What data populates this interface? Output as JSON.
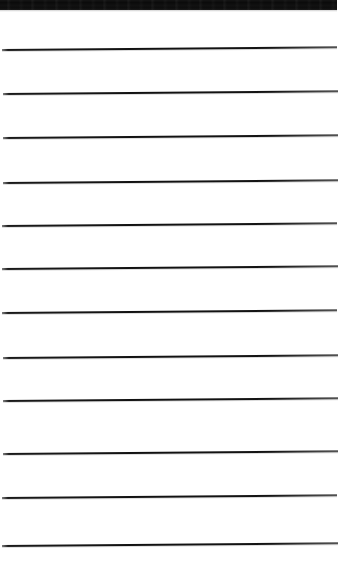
{
  "document": {
    "kind": "scanned-page",
    "subject": "blank ruled notepad page",
    "page_width": 344,
    "page_height": 576,
    "paper_color": "#ffffff",
    "ink_color": "#111111",
    "text_content": "",
    "has_handwriting": false,
    "has_printed_text": false
  },
  "top_edge_band": {
    "name": "top-edge-band",
    "color": "#0d0d0d",
    "x": 0,
    "y": 0,
    "width": 337,
    "height": 10
  },
  "ruling": {
    "line_count": 12,
    "line_color": "#111111",
    "line_thickness": 2,
    "left_margin": 2,
    "right_end": 337,
    "average_spacing": 44,
    "skew_degrees": -0.45,
    "lines": [
      {
        "index": 1,
        "y": 49,
        "x_start": 2,
        "x_end": 337
      },
      {
        "index": 2,
        "y": 93,
        "x_start": 3,
        "x_end": 338
      },
      {
        "index": 3,
        "y": 137,
        "x_start": 3,
        "x_end": 338
      },
      {
        "index": 4,
        "y": 182,
        "x_start": 3,
        "x_end": 338
      },
      {
        "index": 5,
        "y": 225,
        "x_start": 2,
        "x_end": 337
      },
      {
        "index": 6,
        "y": 268,
        "x_start": 2,
        "x_end": 338
      },
      {
        "index": 7,
        "y": 312,
        "x_start": 2,
        "x_end": 337
      },
      {
        "index": 8,
        "y": 357,
        "x_start": 3,
        "x_end": 338
      },
      {
        "index": 9,
        "y": 400,
        "x_start": 3,
        "x_end": 338
      },
      {
        "index": 10,
        "y": 453,
        "x_start": 3,
        "x_end": 338
      },
      {
        "index": 11,
        "y": 497,
        "x_start": 2,
        "x_end": 337
      },
      {
        "index": 12,
        "y": 545,
        "x_start": 2,
        "x_end": 338
      }
    ]
  }
}
